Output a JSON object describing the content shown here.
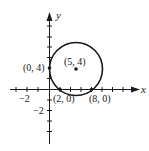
{
  "diagram": {
    "type": "coordinate-plane-circle",
    "axes": {
      "x_label": "x",
      "y_label": "y",
      "tick_labels": {
        "x": [
          "−2"
        ],
        "y": [
          "−2"
        ]
      }
    },
    "circle": {
      "center": [
        5,
        4
      ],
      "radius": 5
    },
    "points": [
      {
        "label": "(5, 4)",
        "x": 5,
        "y": 4
      },
      {
        "label": "(0, 4)",
        "x": 0,
        "y": 4
      },
      {
        "label": "(2, 0)",
        "x": 2,
        "y": 0
      },
      {
        "label": "(8, 0)",
        "x": 8,
        "y": 0
      }
    ],
    "colors": {
      "ink": "#1a1a1a",
      "background": "#ffffff"
    }
  }
}
